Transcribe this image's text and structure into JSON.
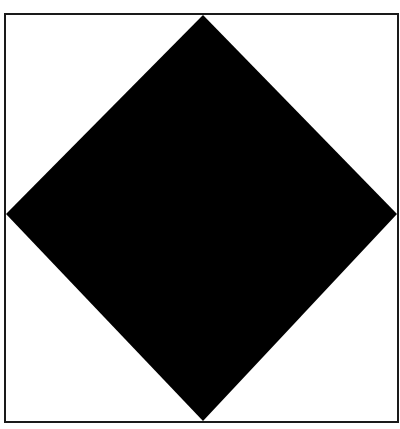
{
  "figure": {
    "background_color": "#ffffff",
    "frame": {
      "x1": 5,
      "y1": 14,
      "x2": 398,
      "y2": 422,
      "stroke": "#1a1a1a",
      "stroke_width": 2
    },
    "diamond": {
      "fill": "#000000",
      "vertices": {
        "top": [
          203,
          15
        ],
        "right": [
          397,
          214
        ],
        "bottom": [
          203,
          421
        ],
        "left": [
          6,
          214
        ]
      }
    }
  }
}
